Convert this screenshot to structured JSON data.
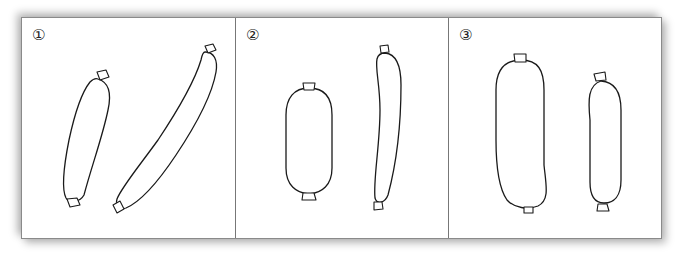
{
  "figure": {
    "panels": [
      {
        "label": "①",
        "items": [
          "sausage-short-curved",
          "sausage-long-diagonal"
        ]
      },
      {
        "label": "②",
        "items": [
          "sausage-thick-oval",
          "sausage-long-thin-curved"
        ]
      },
      {
        "label": "③",
        "items": [
          "sausage-large-thick",
          "sausage-medium"
        ]
      }
    ],
    "colors": {
      "line": "#1a1a1a",
      "background": "#ffffff",
      "frame": "#8a8a8a"
    }
  }
}
